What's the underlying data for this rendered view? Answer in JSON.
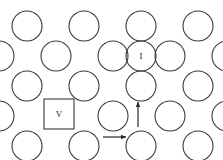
{
  "diagram": {
    "canvas": {
      "width": 223,
      "height": 160,
      "background": "#ffffff"
    },
    "style": {
      "stroke_color": "#3a3a3a",
      "arrow_color": "#2a2a2a",
      "label_color": "#2a2a2a",
      "fill": "none",
      "stroke_width": 1.1,
      "atom_radius": 15,
      "row_spacing": 30,
      "column_spacing": 57
    },
    "atoms": [
      {
        "id": "a-r1-c1",
        "cx": 27,
        "cy": 26,
        "r": 15,
        "label": ""
      },
      {
        "id": "a-r1-c2",
        "cx": 84,
        "cy": 26,
        "r": 15,
        "label": ""
      },
      {
        "id": "a-r1-c3",
        "cx": 141,
        "cy": 26,
        "r": 15,
        "label": ""
      },
      {
        "id": "a-r1-c4",
        "cx": 198,
        "cy": 26,
        "r": 15,
        "label": ""
      },
      {
        "id": "a-r2-c0",
        "cx": -1,
        "cy": 56,
        "r": 15,
        "label": ""
      },
      {
        "id": "a-r2-c1",
        "cx": 56,
        "cy": 56,
        "r": 15,
        "label": ""
      },
      {
        "id": "a-r2-c2",
        "cx": 113,
        "cy": 56,
        "r": 15,
        "label": ""
      },
      {
        "id": "a-r2-i",
        "cx": 141,
        "cy": 56,
        "r": 15,
        "label": "I"
      },
      {
        "id": "a-r2-c3",
        "cx": 170,
        "cy": 56,
        "r": 15,
        "label": ""
      },
      {
        "id": "a-r2-c4",
        "cx": 227,
        "cy": 56,
        "r": 15,
        "label": ""
      },
      {
        "id": "a-r3-c1",
        "cx": 27,
        "cy": 86,
        "r": 15,
        "label": ""
      },
      {
        "id": "a-r3-c2",
        "cx": 84,
        "cy": 86,
        "r": 15,
        "label": ""
      },
      {
        "id": "a-r3-c3",
        "cx": 141,
        "cy": 86,
        "r": 15,
        "label": ""
      },
      {
        "id": "a-r3-c4",
        "cx": 198,
        "cy": 86,
        "r": 15,
        "label": ""
      },
      {
        "id": "a-r4-c0",
        "cx": -1,
        "cy": 116,
        "r": 15,
        "label": ""
      },
      {
        "id": "a-r4-c2",
        "cx": 113,
        "cy": 116,
        "r": 15,
        "label": ""
      },
      {
        "id": "a-r4-c3",
        "cx": 170,
        "cy": 116,
        "r": 15,
        "label": ""
      },
      {
        "id": "a-r4-c4",
        "cx": 227,
        "cy": 116,
        "r": 15,
        "label": ""
      },
      {
        "id": "a-r5-c1",
        "cx": 27,
        "cy": 146,
        "r": 15,
        "label": ""
      },
      {
        "id": "a-r5-c2",
        "cx": 84,
        "cy": 146,
        "r": 15,
        "label": ""
      },
      {
        "id": "a-r5-c3",
        "cx": 141,
        "cy": 146,
        "r": 15,
        "label": ""
      },
      {
        "id": "a-r5-c4",
        "cx": 198,
        "cy": 146,
        "r": 15,
        "label": ""
      }
    ],
    "vacancy": {
      "id": "v-r4-c1",
      "x": 44,
      "y": 99,
      "width": 30,
      "height": 30,
      "label": "V"
    },
    "arrows": [
      {
        "id": "arrow-horizontal",
        "direction": "right",
        "x1": 103,
        "y1": 137,
        "x2": 126,
        "y2": 137
      },
      {
        "id": "arrow-vertical",
        "direction": "up",
        "x1": 138,
        "y1": 127,
        "x2": 138,
        "y2": 102
      }
    ],
    "legend": {
      "interstitial_label": "I",
      "vacancy_label": "V"
    }
  }
}
